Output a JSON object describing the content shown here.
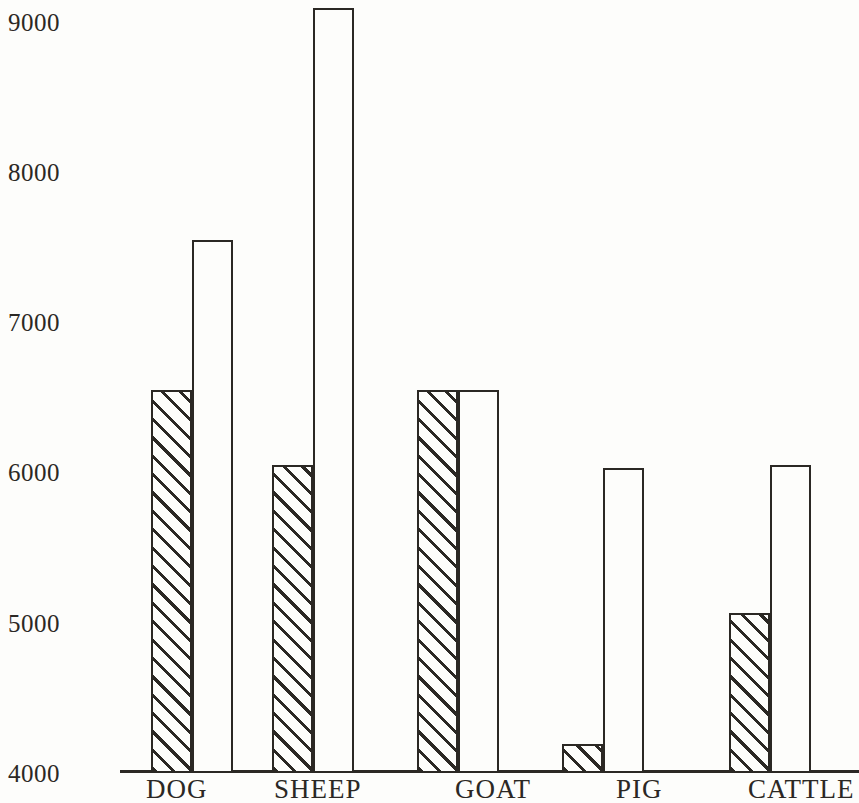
{
  "chart_data": {
    "type": "bar",
    "title": "",
    "subtitle": "",
    "xlabel": "",
    "ylabel": "",
    "categories": [
      "DOG",
      "SHEEP",
      "GOAT",
      "PIG",
      "CATTLE"
    ],
    "series": [
      {
        "name": "hatched",
        "style": "diagonal-hatch",
        "values": [
          6550,
          6050,
          6550,
          4190,
          5065
        ]
      },
      {
        "name": "white",
        "style": "open-outline",
        "values": [
          7550,
          9090,
          6550,
          6030,
          6050
        ]
      }
    ],
    "ylim": [
      4000,
      9100
    ],
    "yticks": [
      4000,
      5000,
      6000,
      7000,
      8000,
      9000
    ],
    "ytick_labels": [
      "4000",
      "5000",
      "6000",
      "7000",
      "8000",
      "9000"
    ],
    "grid": false,
    "legend": "none"
  },
  "axis": {
    "ticks": [
      {
        "label": "9000",
        "value": 9000
      },
      {
        "label": "8000",
        "value": 8000
      },
      {
        "label": "7000",
        "value": 7000
      },
      {
        "label": "6000",
        "value": 6000
      },
      {
        "label": "5000",
        "value": 5000
      },
      {
        "label": "4000",
        "value": 4000
      }
    ]
  },
  "colors": {
    "ink": "#2b2824",
    "paper": "#fdfdfb"
  }
}
